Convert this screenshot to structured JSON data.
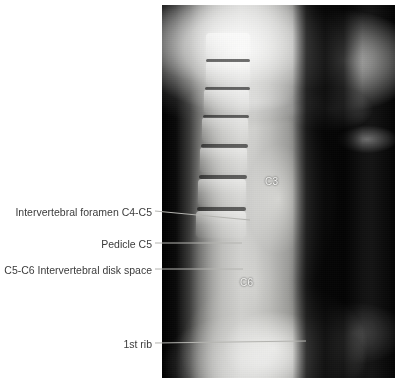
{
  "figure": {
    "type": "radiograph",
    "modality": "X-ray",
    "view": "lateral cervical spine",
    "background_color": "#ffffff",
    "panel": {
      "x": 162,
      "y": 5,
      "width": 233,
      "height": 373,
      "background_color": "#050505"
    }
  },
  "image_labels": [
    {
      "text": "C3",
      "x": 265,
      "y": 182,
      "color": "#f4f4f2"
    },
    {
      "text": "C6",
      "x": 240,
      "y": 283,
      "color": "#f4f4f2"
    }
  ],
  "annotations": [
    {
      "id": "foramen-c4-c5",
      "text": "Intervertebral foramen C4-C5",
      "text_x": 152,
      "text_y": 212,
      "clipped_left": false,
      "leader": {
        "x1": 155,
        "y1": 211,
        "x2": 250,
        "y2": 220
      }
    },
    {
      "id": "pedicle-c5",
      "text": "Pedicle C5",
      "text_x": 152,
      "text_y": 244,
      "clipped_left": false,
      "leader": {
        "x1": 155,
        "y1": 243,
        "x2": 242,
        "y2": 243
      }
    },
    {
      "id": "c5-c6-disk-space",
      "text": "C5-C6 Intervertebral disk space",
      "text_x": 152,
      "text_y": 270,
      "clipped_left": true,
      "leader": {
        "x1": 155,
        "y1": 269,
        "x2": 243,
        "y2": 269
      }
    },
    {
      "id": "first-rib",
      "text": "1st rib",
      "text_x": 152,
      "text_y": 344,
      "clipped_left": false,
      "leader": {
        "x1": 155,
        "y1": 343,
        "x2": 306,
        "y2": 341
      }
    }
  ],
  "leader_line": {
    "color": "#b4b4b0",
    "width": 1
  },
  "anatomy": {
    "vertebral_bodies": [
      {
        "name": "C2",
        "x": 44,
        "y": 28,
        "w": 44,
        "h": 26
      },
      {
        "name": "C3",
        "x": 44,
        "y": 56,
        "w": 44,
        "h": 24
      },
      {
        "name": "C4",
        "x": 42,
        "y": 84,
        "w": 45,
        "h": 24
      },
      {
        "name": "C5",
        "x": 40,
        "y": 112,
        "w": 46,
        "h": 24
      },
      {
        "name": "C6",
        "x": 38,
        "y": 142,
        "w": 47,
        "h": 25
      },
      {
        "name": "C7",
        "x": 36,
        "y": 174,
        "w": 48,
        "h": 26
      },
      {
        "name": "T1",
        "x": 34,
        "y": 206,
        "w": 50,
        "h": 26
      }
    ],
    "disk_spaces": [
      {
        "y": 54
      },
      {
        "y": 82
      },
      {
        "y": 110
      },
      {
        "y": 139
      },
      {
        "y": 170
      },
      {
        "y": 202
      }
    ]
  }
}
